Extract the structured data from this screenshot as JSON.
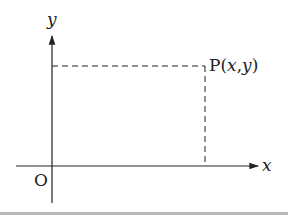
{
  "diagram": {
    "type": "coordinate-plane",
    "axes": {
      "x_label": "x",
      "y_label": "y",
      "origin_label": "O"
    },
    "point": {
      "name": "P",
      "label_open": "P(",
      "label_x": "x",
      "label_comma": ",",
      "label_y": "y",
      "label_close": ")"
    },
    "colors": {
      "ink": "#222222",
      "rule": "#b9b9b9"
    }
  }
}
